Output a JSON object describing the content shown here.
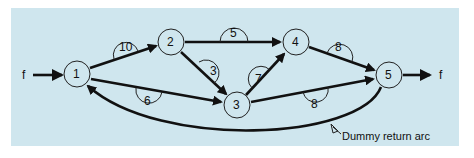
{
  "diagram": {
    "type": "network-flow",
    "background_color": "#cfe6ee",
    "source_label": "f",
    "sink_label": "f",
    "nodes": [
      {
        "id": "1",
        "label": "1",
        "x": 77,
        "y": 74
      },
      {
        "id": "2",
        "label": "2",
        "x": 171,
        "y": 42
      },
      {
        "id": "3",
        "label": "3",
        "x": 237,
        "y": 105
      },
      {
        "id": "4",
        "label": "4",
        "x": 296,
        "y": 42
      },
      {
        "id": "5",
        "label": "5",
        "x": 389,
        "y": 75
      }
    ],
    "edges": [
      {
        "from": "1",
        "to": "2",
        "capacity": "10"
      },
      {
        "from": "1",
        "to": "3",
        "capacity": "6"
      },
      {
        "from": "2",
        "to": "4",
        "capacity": "5"
      },
      {
        "from": "2",
        "to": "3",
        "capacity": "3"
      },
      {
        "from": "3",
        "to": "4",
        "capacity": "7"
      },
      {
        "from": "3",
        "to": "5",
        "capacity": "8"
      },
      {
        "from": "4",
        "to": "5",
        "capacity": "8"
      },
      {
        "from": "5",
        "to": "1",
        "capacity": "",
        "note": "Dummy return arc"
      }
    ],
    "annotation": "Dummy return arc"
  }
}
